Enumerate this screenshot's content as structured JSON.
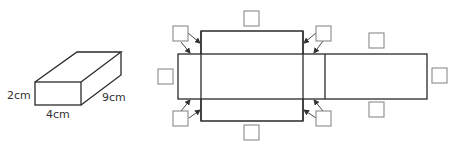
{
  "cuboid": {
    "labels": {
      "height": "2cm",
      "width": "4cm",
      "depth": "9cm"
    }
  },
  "net": {
    "answer_boxes": [
      {
        "id": "top-left-corner",
        "value": ""
      },
      {
        "id": "top-center",
        "value": ""
      },
      {
        "id": "top-right-corner",
        "value": ""
      },
      {
        "id": "right-top",
        "value": ""
      },
      {
        "id": "left-side",
        "value": ""
      },
      {
        "id": "right-side",
        "value": ""
      },
      {
        "id": "bottom-left-corner",
        "value": ""
      },
      {
        "id": "bottom-center",
        "value": ""
      },
      {
        "id": "bottom-right-corner",
        "value": ""
      },
      {
        "id": "right-bottom",
        "value": ""
      }
    ]
  },
  "colors": {
    "line": "#2a2a2a",
    "box_border": "#8a8a8a",
    "text": "#333333"
  }
}
